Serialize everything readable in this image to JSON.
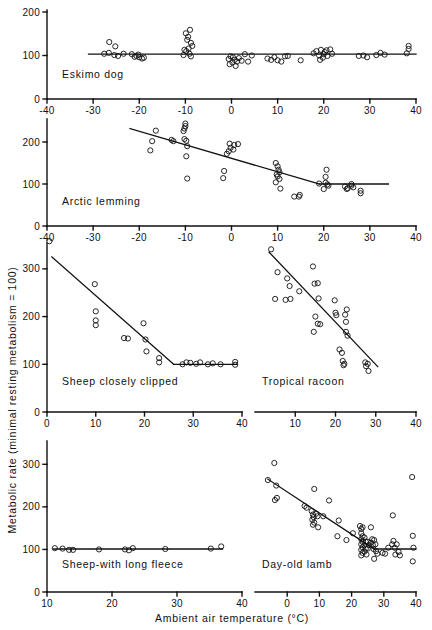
{
  "figure": {
    "ylabel": "Metabolic rate (minimal resting metabolism = 100)",
    "xlabel": "Ambient air temperature (°C)",
    "axis_color": "#111111",
    "marker": "open-circle"
  },
  "chart_data": [
    {
      "type": "scatter",
      "title": "Eskimo dog",
      "xlabel": "",
      "ylabel": "",
      "xlim": [
        -40,
        40
      ],
      "ylim": [
        0,
        200
      ],
      "xticks": [
        -40,
        -30,
        -20,
        -10,
        0,
        10,
        20,
        30,
        40
      ],
      "yticks": [
        0,
        100,
        200
      ],
      "grid": false,
      "fit_line": {
        "type": "horizontal",
        "y": 103,
        "x_start": -31,
        "x_end": 40
      },
      "points": [
        [
          -26.5,
          131
        ],
        [
          -25.2,
          121
        ],
        [
          -27.6,
          104
        ],
        [
          -26.6,
          106
        ],
        [
          -25.4,
          101
        ],
        [
          -24.6,
          99
        ],
        [
          -23.4,
          104
        ],
        [
          -21.6,
          103
        ],
        [
          -21.0,
          97
        ],
        [
          -20.6,
          99
        ],
        [
          -20.0,
          96
        ],
        [
          -19.4,
          93
        ],
        [
          -20.2,
          102
        ],
        [
          -19.0,
          95
        ],
        [
          -9.9,
          151
        ],
        [
          -9.4,
          143
        ],
        [
          -9.0,
          159
        ],
        [
          -9.6,
          136
        ],
        [
          -8.8,
          129
        ],
        [
          -8.5,
          122
        ],
        [
          -10.2,
          113
        ],
        [
          -9.8,
          110
        ],
        [
          -9.3,
          116
        ],
        [
          -10.4,
          101
        ],
        [
          -9.1,
          104
        ],
        [
          -8.8,
          98
        ],
        [
          -0.6,
          92
        ],
        [
          -0.2,
          98
        ],
        [
          0.3,
          96
        ],
        [
          0.7,
          90
        ],
        [
          1.2,
          86
        ],
        [
          0.2,
          84
        ],
        [
          -0.4,
          80
        ],
        [
          0.9,
          76
        ],
        [
          1.6,
          94
        ],
        [
          2.2,
          88
        ],
        [
          2.9,
          103
        ],
        [
          3.6,
          86
        ],
        [
          4.4,
          100
        ],
        [
          7.8,
          93
        ],
        [
          8.6,
          90
        ],
        [
          9.3,
          96
        ],
        [
          10.0,
          89
        ],
        [
          10.8,
          86
        ],
        [
          11.6,
          98
        ],
        [
          12.2,
          99
        ],
        [
          15.0,
          89
        ],
        [
          17.8,
          105
        ],
        [
          18.4,
          110
        ],
        [
          19.0,
          100
        ],
        [
          19.4,
          113
        ],
        [
          19.8,
          95
        ],
        [
          20.2,
          108
        ],
        [
          20.6,
          112
        ],
        [
          20.0,
          103
        ],
        [
          19.2,
          90
        ],
        [
          20.8,
          99
        ],
        [
          21.4,
          114
        ],
        [
          21.8,
          104
        ],
        [
          27.6,
          99
        ],
        [
          28.6,
          100
        ],
        [
          29.4,
          96
        ],
        [
          31.4,
          101
        ],
        [
          32.3,
          106
        ],
        [
          33.2,
          102
        ],
        [
          38.4,
          122
        ],
        [
          38.4,
          115
        ],
        [
          38.0,
          105
        ]
      ]
    },
    {
      "type": "scatter",
      "title": "Arctic lemming",
      "xlabel": "",
      "ylabel": "",
      "xlim": [
        -40,
        40
      ],
      "ylim": [
        0,
        250
      ],
      "xticks": [
        -40,
        -30,
        -20,
        -10,
        0,
        10,
        20,
        30,
        40
      ],
      "yticks": [
        0,
        100,
        200
      ],
      "grid": false,
      "fit_line": {
        "type": "broken",
        "x_start": -22,
        "y_start": 232,
        "x_break": 19,
        "y_break": 100,
        "x_end": 34
      },
      "points": [
        [
          -16.4,
          227
        ],
        [
          -17.2,
          202
        ],
        [
          -17.6,
          180
        ],
        [
          -10.0,
          244
        ],
        [
          -10.0,
          238
        ],
        [
          -10.2,
          232
        ],
        [
          -10.4,
          226
        ],
        [
          -10.2,
          207
        ],
        [
          -9.8,
          203
        ],
        [
          -9.6,
          190
        ],
        [
          -9.8,
          166
        ],
        [
          -9.6,
          113
        ],
        [
          -13.0,
          205
        ],
        [
          -12.6,
          202
        ],
        [
          -0.4,
          196
        ],
        [
          0.6,
          193
        ],
        [
          1.4,
          195
        ],
        [
          -0.2,
          186
        ],
        [
          0.4,
          182
        ],
        [
          -0.6,
          178
        ],
        [
          -1.0,
          172
        ],
        [
          -1.6,
          131
        ],
        [
          -1.8,
          114
        ],
        [
          9.6,
          150
        ],
        [
          10.0,
          142
        ],
        [
          10.2,
          134
        ],
        [
          10.4,
          128
        ],
        [
          9.8,
          123
        ],
        [
          10.0,
          118
        ],
        [
          10.4,
          112
        ],
        [
          9.6,
          104
        ],
        [
          10.6,
          89
        ],
        [
          13.6,
          70
        ],
        [
          14.6,
          70
        ],
        [
          14.8,
          74
        ],
        [
          19.0,
          101
        ],
        [
          20.4,
          103
        ],
        [
          20.8,
          99
        ],
        [
          21.0,
          96
        ],
        [
          20.0,
          88
        ],
        [
          20.6,
          134
        ],
        [
          20.4,
          117
        ],
        [
          24.6,
          94
        ],
        [
          25.2,
          90
        ],
        [
          25.0,
          88
        ],
        [
          26.0,
          100
        ],
        [
          26.0,
          96
        ],
        [
          26.4,
          92
        ],
        [
          28.0,
          84
        ],
        [
          28.0,
          78
        ]
      ]
    },
    {
      "type": "scatter",
      "title": "Sheep closely clipped",
      "xlabel": "",
      "ylabel": "",
      "xlim": [
        0,
        40
      ],
      "ylim": [
        0,
        350
      ],
      "xticks": [
        0,
        10,
        20,
        30,
        40
      ],
      "yticks": [
        0,
        100,
        200,
        300
      ],
      "grid": false,
      "fit_line": {
        "type": "broken",
        "x_start": 1,
        "y_start": 325,
        "x_break": 26,
        "y_break": 100,
        "x_end": 39
      },
      "points": [
        [
          0.5,
          358
        ],
        [
          9.8,
          268
        ],
        [
          10.0,
          211
        ],
        [
          10.0,
          192
        ],
        [
          10.0,
          182
        ],
        [
          15.8,
          155
        ],
        [
          16.6,
          154
        ],
        [
          19.8,
          186
        ],
        [
          20.2,
          152
        ],
        [
          20.4,
          127
        ],
        [
          23.0,
          113
        ],
        [
          23.0,
          104
        ],
        [
          27.8,
          100
        ],
        [
          28.6,
          104
        ],
        [
          29.4,
          103
        ],
        [
          30.6,
          101
        ],
        [
          31.4,
          104
        ],
        [
          33.0,
          100
        ],
        [
          34.0,
          102
        ],
        [
          35.6,
          100
        ],
        [
          38.6,
          105
        ],
        [
          38.6,
          99
        ]
      ]
    },
    {
      "type": "scatter",
      "title": "Tropical racoon",
      "xlabel": "",
      "ylabel": "",
      "xlim": [
        0,
        40
      ],
      "ylim": [
        0,
        350
      ],
      "xticks": [
        10,
        20,
        30,
        40
      ],
      "yticks": [],
      "grid": false,
      "fit_line": {
        "type": "linear",
        "x_start": 3.5,
        "y_start": 335,
        "x_end": 30.5,
        "y_end": 95
      },
      "points": [
        [
          4.0,
          341
        ],
        [
          5.6,
          293
        ],
        [
          5.0,
          237
        ],
        [
          8.0,
          280
        ],
        [
          8.6,
          264
        ],
        [
          8.8,
          237
        ],
        [
          7.6,
          235
        ],
        [
          11.0,
          253
        ],
        [
          14.4,
          305
        ],
        [
          14.8,
          269
        ],
        [
          15.6,
          270
        ],
        [
          15.8,
          238
        ],
        [
          14.6,
          168
        ],
        [
          15.6,
          185
        ],
        [
          16.2,
          184
        ],
        [
          15.0,
          200
        ],
        [
          19.8,
          234
        ],
        [
          20.0,
          208
        ],
        [
          20.2,
          203
        ],
        [
          22.4,
          204
        ],
        [
          22.6,
          189
        ],
        [
          22.8,
          215
        ],
        [
          22.6,
          168
        ],
        [
          21.0,
          131
        ],
        [
          21.6,
          124
        ],
        [
          23.0,
          160
        ],
        [
          21.8,
          107
        ],
        [
          22.2,
          101
        ],
        [
          22.0,
          98
        ],
        [
          27.4,
          104
        ],
        [
          28.0,
          101
        ],
        [
          27.6,
          96
        ],
        [
          28.2,
          86
        ]
      ]
    },
    {
      "type": "scatter",
      "title": "Sheep-with long fleece",
      "xlabel": "",
      "ylabel": "",
      "xlim": [
        10,
        40
      ],
      "ylim": [
        0,
        350
      ],
      "xticks": [
        10,
        20,
        30,
        40
      ],
      "yticks": [
        0,
        100,
        200,
        300
      ],
      "grid": false,
      "fit_line": {
        "type": "horizontal",
        "y": 101,
        "x_start": 11,
        "x_end": 37
      },
      "points": [
        [
          11.2,
          103
        ],
        [
          12.4,
          102
        ],
        [
          13.4,
          99
        ],
        [
          14.0,
          99
        ],
        [
          18.0,
          100
        ],
        [
          22.0,
          100
        ],
        [
          22.6,
          98
        ],
        [
          23.2,
          103
        ],
        [
          28.2,
          101
        ],
        [
          35.2,
          102
        ],
        [
          36.8,
          107
        ]
      ]
    },
    {
      "type": "scatter",
      "title": "Day-old lamb",
      "xlabel": "",
      "ylabel": "",
      "xlim": [
        -10,
        40
      ],
      "ylim": [
        0,
        350
      ],
      "xticks": [
        0,
        10,
        20,
        30,
        40
      ],
      "yticks": [],
      "grid": false,
      "fit_line": {
        "type": "broken",
        "x_start": -6,
        "y_start": 265,
        "x_break": 27,
        "y_break": 101,
        "x_end": 40
      },
      "points": [
        [
          -6.0,
          263
        ],
        [
          -4.0,
          303
        ],
        [
          -3.4,
          250
        ],
        [
          -3.8,
          216
        ],
        [
          -3.2,
          221
        ],
        [
          5.4,
          202
        ],
        [
          6.0,
          198
        ],
        [
          7.6,
          190
        ],
        [
          8.0,
          182
        ],
        [
          8.2,
          176
        ],
        [
          7.8,
          170
        ],
        [
          8.4,
          163
        ],
        [
          8.0,
          158
        ],
        [
          9.0,
          184
        ],
        [
          9.4,
          178
        ],
        [
          9.6,
          152
        ],
        [
          8.4,
          242
        ],
        [
          11.2,
          178
        ],
        [
          13.0,
          215
        ],
        [
          16.0,
          168
        ],
        [
          15.6,
          131
        ],
        [
          18.4,
          122
        ],
        [
          20.4,
          138
        ],
        [
          22.6,
          155
        ],
        [
          23.0,
          148
        ],
        [
          23.4,
          152
        ],
        [
          23.0,
          138
        ],
        [
          23.4,
          131
        ],
        [
          23.0,
          124
        ],
        [
          23.4,
          118
        ],
        [
          23.0,
          112
        ],
        [
          23.4,
          105
        ],
        [
          23.0,
          99
        ],
        [
          23.4,
          92
        ],
        [
          23.0,
          86
        ],
        [
          24.0,
          128
        ],
        [
          24.4,
          118
        ],
        [
          24.0,
          110
        ],
        [
          24.4,
          102
        ],
        [
          24.0,
          95
        ],
        [
          24.6,
          88
        ],
        [
          25.0,
          118
        ],
        [
          25.4,
          110
        ],
        [
          25.0,
          102
        ],
        [
          26.0,
          152
        ],
        [
          26.4,
          124
        ],
        [
          26.0,
          116
        ],
        [
          26.6,
          110
        ],
        [
          27.0,
          122
        ],
        [
          27.4,
          112
        ],
        [
          26.8,
          101
        ],
        [
          27.6,
          96
        ],
        [
          28.0,
          90
        ],
        [
          27.0,
          78
        ],
        [
          29.6,
          92
        ],
        [
          30.4,
          90
        ],
        [
          31.4,
          104
        ],
        [
          32.6,
          112
        ],
        [
          33.0,
          120
        ],
        [
          33.4,
          104
        ],
        [
          32.8,
          180
        ],
        [
          34.0,
          112
        ],
        [
          33.6,
          88
        ],
        [
          34.6,
          94
        ],
        [
          35.0,
          86
        ],
        [
          38.8,
          270
        ],
        [
          39.0,
          132
        ],
        [
          39.2,
          104
        ],
        [
          39.0,
          72
        ]
      ]
    }
  ]
}
